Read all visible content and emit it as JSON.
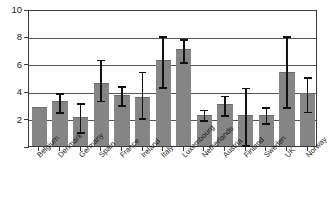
{
  "chart_data": {
    "type": "bar",
    "title": "",
    "subtitle": "",
    "xlabel": "",
    "ylabel": "",
    "ylim": [
      0,
      10
    ],
    "yticks": [
      0,
      2,
      4,
      6,
      8,
      10
    ],
    "ytick_labels": [
      "0",
      "2",
      "4",
      "6",
      "8",
      "10"
    ],
    "grid": true,
    "grid_axis": "y",
    "legend": false,
    "legend_position": "none",
    "bar_color": "#858585",
    "error_bar_color": "#111111",
    "categories": [
      "Belgium",
      "Denmark",
      "Germany",
      "Spain",
      "France",
      "Ireland",
      "Italy",
      "Luxembourg",
      "Netherlands",
      "Austria",
      "Finland",
      "Sweden",
      "UK",
      "Norway"
    ],
    "values": [
      2.85,
      3.25,
      2.1,
      4.6,
      3.7,
      3.6,
      6.3,
      7.1,
      2.3,
      3.05,
      2.3,
      2.3,
      5.4,
      3.9
    ],
    "error_low": [
      2.85,
      2.55,
      1.1,
      3.4,
      3.05,
      2.1,
      4.4,
      6.2,
      1.95,
      2.35,
      0.15,
      1.75,
      2.9,
      2.6
    ],
    "error_high": [
      2.85,
      3.95,
      3.2,
      6.4,
      4.45,
      5.5,
      8.1,
      7.9,
      2.75,
      3.75,
      4.35,
      2.9,
      8.1,
      5.1
    ]
  },
  "axis": {
    "y_tick_labels": [
      "0",
      "2",
      "4",
      "6",
      "8",
      "10"
    ]
  }
}
